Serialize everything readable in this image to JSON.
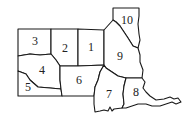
{
  "map": {
    "type": "numbered-region-map",
    "colors": {
      "fill": "#ffffff",
      "border": "#1a1a1a",
      "text": "#222222"
    },
    "regions": [
      {
        "id": "1",
        "label": "1"
      },
      {
        "id": "2",
        "label": "2"
      },
      {
        "id": "3",
        "label": "3"
      },
      {
        "id": "4",
        "label": "4"
      },
      {
        "id": "5",
        "label": "5"
      },
      {
        "id": "6",
        "label": "6"
      },
      {
        "id": "7",
        "label": "7"
      },
      {
        "id": "8",
        "label": "8"
      },
      {
        "id": "9",
        "label": "9"
      },
      {
        "id": "10",
        "label": "10"
      }
    ]
  }
}
